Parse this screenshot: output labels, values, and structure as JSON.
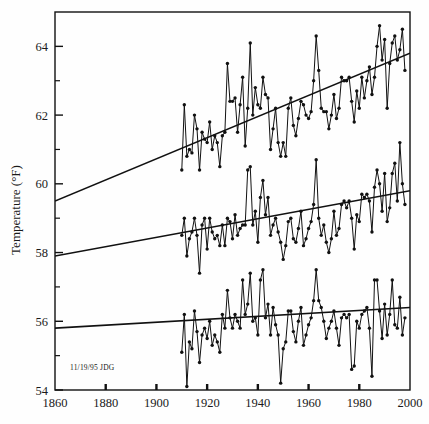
{
  "figure": {
    "background_color": "#fefefe",
    "ink_color": "#111111",
    "annotation": "11/19/95 JDG"
  },
  "axes": {
    "y_title": "Temperature (°F)",
    "x_title": "",
    "y_ticks": [
      "54",
      "56",
      "58",
      "60",
      "62",
      "64"
    ],
    "x_ticks": [
      "1860",
      "1880",
      "1900",
      "1920",
      "1940",
      "1960",
      "1980",
      "2000"
    ],
    "y_minor_count_between": 1,
    "grid": "off",
    "frame": "box"
  },
  "chart_data": {
    "type": "line",
    "title": "",
    "xlabel": "",
    "ylabel": "Temperature (°F)",
    "xlim": [
      1860,
      2000
    ],
    "ylim": [
      54,
      65
    ],
    "yticks": [
      54,
      56,
      58,
      60,
      62,
      64
    ],
    "xticks": [
      1860,
      1880,
      1900,
      1920,
      1940,
      1960,
      1980,
      2000
    ],
    "grid": false,
    "legend": "none",
    "marker": "filled-circle",
    "annotations": [
      {
        "text": "11/19/95 JDG",
        "x": 1880,
        "y": 54.35
      }
    ],
    "x": [
      1910,
      1911,
      1912,
      1913,
      1914,
      1915,
      1916,
      1917,
      1918,
      1919,
      1920,
      1921,
      1922,
      1923,
      1924,
      1925,
      1926,
      1927,
      1928,
      1929,
      1930,
      1931,
      1932,
      1933,
      1934,
      1935,
      1936,
      1937,
      1938,
      1939,
      1940,
      1941,
      1942,
      1943,
      1944,
      1945,
      1946,
      1947,
      1948,
      1949,
      1950,
      1951,
      1952,
      1953,
      1954,
      1955,
      1956,
      1957,
      1958,
      1959,
      1960,
      1961,
      1962,
      1963,
      1964,
      1965,
      1966,
      1967,
      1968,
      1969,
      1970,
      1971,
      1972,
      1973,
      1974,
      1975,
      1976,
      1977,
      1978,
      1979,
      1980,
      1981,
      1982,
      1983,
      1984,
      1985,
      1986,
      1987,
      1988,
      1989,
      1990,
      1991,
      1992,
      1993,
      1994,
      1995,
      1996,
      1997,
      1998
    ],
    "series": [
      {
        "name": "Maximum temperature",
        "trend_line": {
          "x": [
            1860,
            2000
          ],
          "y": [
            59.5,
            63.8
          ]
        },
        "values": [
          60.4,
          62.3,
          60.8,
          61.0,
          60.9,
          62.0,
          61.6,
          60.4,
          61.5,
          61.3,
          61.2,
          61.8,
          61.0,
          61.4,
          61.2,
          60.5,
          61.4,
          61.5,
          63.5,
          62.4,
          62.4,
          62.5,
          61.5,
          62.3,
          63.1,
          61.1,
          62.2,
          64.1,
          62.0,
          62.8,
          62.3,
          62.2,
          63.1,
          62.6,
          62.5,
          61.0,
          61.6,
          62.2,
          61.2,
          60.8,
          61.2,
          60.8,
          62.2,
          62.5,
          61.7,
          61.4,
          61.9,
          62.4,
          62.3,
          62.0,
          61.9,
          62.1,
          63.0,
          64.3,
          63.3,
          62.2,
          62.1,
          62.1,
          61.6,
          62.0,
          62.6,
          61.9,
          62.2,
          63.1,
          63.0,
          63.0,
          63.1,
          62.4,
          61.8,
          62.7,
          62.2,
          63.1,
          62.5,
          63.0,
          63.4,
          62.6,
          63.1,
          64.0,
          64.6,
          63.6,
          64.2,
          62.2,
          63.5,
          64.1,
          64.3,
          63.6,
          63.9,
          64.5,
          63.3
        ]
      },
      {
        "name": "Mean temperature",
        "trend_line": {
          "x": [
            1860,
            2000
          ],
          "y": [
            57.9,
            59.8
          ]
        },
        "values": [
          58.5,
          59.0,
          57.9,
          58.4,
          58.6,
          59.0,
          58.5,
          57.4,
          58.8,
          59.0,
          58.1,
          59.0,
          58.6,
          58.4,
          58.5,
          58.2,
          58.8,
          58.2,
          59.0,
          58.9,
          58.4,
          59.1,
          58.5,
          58.7,
          58.8,
          58.8,
          60.4,
          60.5,
          58.8,
          59.2,
          58.3,
          59.6,
          60.1,
          59.1,
          59.6,
          58.5,
          58.8,
          59.0,
          58.6,
          58.3,
          57.8,
          58.2,
          58.9,
          59.0,
          58.4,
          58.3,
          58.7,
          59.2,
          58.2,
          58.4,
          58.7,
          58.9,
          59.4,
          60.7,
          59.0,
          58.5,
          58.8,
          58.3,
          58.0,
          58.4,
          59.2,
          58.5,
          58.7,
          59.4,
          59.5,
          59.3,
          59.5,
          59.0,
          58.1,
          59.1,
          58.9,
          59.7,
          59.6,
          59.7,
          59.5,
          58.6,
          59.9,
          60.4,
          60.0,
          59.2,
          60.3,
          58.9,
          59.3,
          60.3,
          60.6,
          59.5,
          61.2,
          60.0,
          59.4
        ]
      },
      {
        "name": "Minimum temperature",
        "trend_line": {
          "x": [
            1860,
            2000
          ],
          "y": [
            55.8,
            56.4
          ]
        },
        "values": [
          55.1,
          56.2,
          54.1,
          55.4,
          55.2,
          56.3,
          55.7,
          54.8,
          55.6,
          55.8,
          55.5,
          56.0,
          55.3,
          55.6,
          55.4,
          55.1,
          56.2,
          55.8,
          56.9,
          56.1,
          55.8,
          56.2,
          56.0,
          55.8,
          57.2,
          56.2,
          56.5,
          57.4,
          56.0,
          56.1,
          55.6,
          57.2,
          57.5,
          56.1,
          56.5,
          55.6,
          56.4,
          55.9,
          55.6,
          54.2,
          55.2,
          55.4,
          56.3,
          56.3,
          55.7,
          55.4,
          56.0,
          56.4,
          55.3,
          55.6,
          55.9,
          56.1,
          56.6,
          57.5,
          56.6,
          56.4,
          56.0,
          55.5,
          55.8,
          56.0,
          56.3,
          55.8,
          55.3,
          56.1,
          56.2,
          56.1,
          56.2,
          54.6,
          54.7,
          56.0,
          55.8,
          56.2,
          56.3,
          56.4,
          55.8,
          54.4,
          57.2,
          57.2,
          56.3,
          55.5,
          56.5,
          55.6,
          56.2,
          57.2,
          55.9,
          55.8,
          56.7,
          55.6,
          56.1
        ]
      }
    ]
  }
}
